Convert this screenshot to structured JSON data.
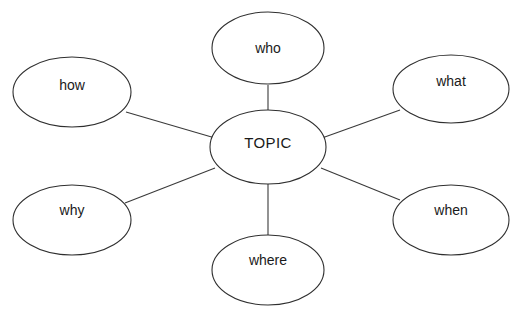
{
  "diagram": {
    "type": "bubble-concept-map",
    "title": "Topic concept map with 5 Ws and How",
    "background_color": "#ffffff",
    "stroke_color": "#2f2f2f",
    "text_color": "#1a1a1a",
    "center": {
      "id": "topic",
      "label": "TOPIC",
      "cx": 268,
      "cy": 147,
      "rx": 58,
      "ry": 37
    },
    "nodes": [
      {
        "id": "who",
        "label": "who",
        "cx": 268,
        "cy": 48,
        "rx": 56,
        "ry": 36,
        "position": "top"
      },
      {
        "id": "what",
        "label": "what",
        "cx": 451,
        "cy": 89,
        "rx": 58,
        "ry": 34,
        "position": "top-right"
      },
      {
        "id": "when",
        "label": "when",
        "cx": 451,
        "cy": 220,
        "rx": 58,
        "ry": 35,
        "position": "bottom-right"
      },
      {
        "id": "where",
        "label": "where",
        "cx": 268,
        "cy": 270,
        "rx": 56,
        "ry": 35,
        "position": "bottom"
      },
      {
        "id": "why",
        "label": "why",
        "cx": 72,
        "cy": 220,
        "rx": 59,
        "ry": 35,
        "position": "bottom-left"
      },
      {
        "id": "how",
        "label": "how",
        "cx": 72,
        "cy": 92,
        "rx": 59,
        "ry": 35,
        "position": "top-left"
      }
    ],
    "connectors": [
      {
        "id": "topic-who",
        "from": "topic",
        "to": "who",
        "x1": 268,
        "y1": 111,
        "x2": 268,
        "y2": 85
      },
      {
        "id": "topic-what",
        "from": "topic",
        "to": "what",
        "x1": 322,
        "y1": 138,
        "x2": 400,
        "y2": 110
      },
      {
        "id": "topic-when",
        "from": "topic",
        "to": "when",
        "x1": 321,
        "y1": 168,
        "x2": 400,
        "y2": 200
      },
      {
        "id": "topic-where",
        "from": "topic",
        "to": "where",
        "x1": 268,
        "y1": 184,
        "x2": 268,
        "y2": 236
      },
      {
        "id": "topic-why",
        "from": "topic",
        "to": "why",
        "x1": 215,
        "y1": 168,
        "x2": 125,
        "y2": 203
      },
      {
        "id": "topic-how",
        "from": "topic",
        "to": "how",
        "x1": 215,
        "y1": 138,
        "x2": 126,
        "y2": 112
      }
    ]
  },
  "artifact": {
    "top_cropped_text": ""
  }
}
